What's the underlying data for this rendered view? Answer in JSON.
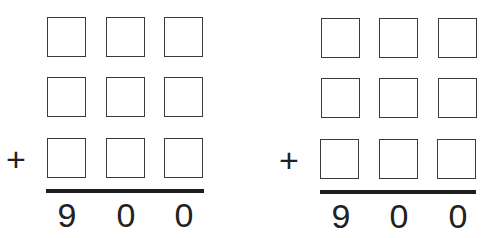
{
  "problems": [
    {
      "operator": "+",
      "rows": [
        [
          "",
          "",
          ""
        ],
        [
          "",
          "",
          ""
        ],
        [
          "",
          "",
          ""
        ]
      ],
      "result_digits": [
        "9",
        "0",
        "0"
      ]
    },
    {
      "operator": "+",
      "rows": [
        [
          "",
          "",
          ""
        ],
        [
          "",
          "",
          ""
        ],
        [
          "",
          "",
          ""
        ]
      ],
      "result_digits": [
        "9",
        "0",
        "0"
      ]
    }
  ],
  "colors": {
    "box_border": "#3a3a3a",
    "rule": "#1e1e1e",
    "text": "#222222"
  }
}
